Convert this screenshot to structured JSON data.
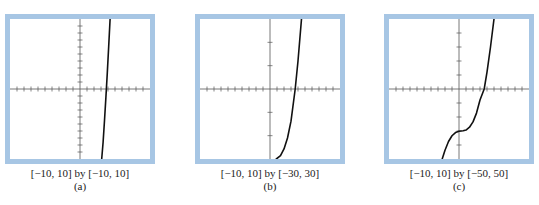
{
  "figure": {
    "panels": [
      {
        "id": "a",
        "window_label": "[−10, 10] by [−10, 10]",
        "panel_label": "(a)"
      },
      {
        "id": "b",
        "window_label": "[−10, 10] by [−30, 30]",
        "panel_label": "(b)"
      },
      {
        "id": "c",
        "window_label": "[−10, 10] by [−50, 50]",
        "panel_label": "(c)"
      }
    ],
    "colors": {
      "frame": "#a7c6e4",
      "axes": "#555555",
      "curve": "#111111"
    }
  },
  "chart_data": [
    {
      "type": "line",
      "title": "(a)",
      "window": "[−10, 10] by [−10, 10]",
      "xlim": [
        -10,
        10
      ],
      "ylim": [
        -10,
        10
      ],
      "xtick_step": 1,
      "ytick_step": 1,
      "grid": false,
      "series": [
        {
          "name": "f(x)",
          "x": [
            3.1,
            3.3,
            3.5,
            3.7,
            3.9,
            4.1,
            4.3
          ],
          "y": [
            -10,
            -7.6,
            -4.5,
            -1.2,
            2.3,
            6.1,
            10
          ]
        }
      ]
    },
    {
      "type": "line",
      "title": "(b)",
      "window": "[−10, 10] by [−30, 30]",
      "xlim": [
        -10,
        10
      ],
      "ylim": [
        -30,
        30
      ],
      "xtick_step": 1,
      "ytick_step": 10,
      "grid": false,
      "series": [
        {
          "name": "f(x)",
          "x": [
            0.9,
            1.5,
            2.0,
            2.5,
            3.0,
            3.6,
            4.0,
            4.5
          ],
          "y": [
            -30,
            -28.6,
            -25.7,
            -21,
            -13.8,
            0,
            12,
            30
          ]
        }
      ]
    },
    {
      "type": "line",
      "title": "(c)",
      "window": "[−10, 10] by [−50, 50]",
      "xlim": [
        -10,
        10
      ],
      "ylim": [
        -50,
        50
      ],
      "xtick_step": 1,
      "ytick_step": 10,
      "grid": false,
      "series": [
        {
          "name": "f(x)",
          "x": [
            -2.4,
            -2.0,
            -1.5,
            -1.0,
            -0.5,
            0.0,
            0.3,
            0.6,
            1.0,
            1.5,
            2.0,
            2.5,
            3.0,
            3.6,
            4.0,
            4.5,
            5.0
          ],
          "y": [
            -50,
            -43.7,
            -37.5,
            -33.4,
            -31.1,
            -30.2,
            -30,
            -29.8,
            -29.3,
            -27.3,
            -23.5,
            -17.2,
            -7.9,
            0,
            12,
            30,
            50
          ]
        }
      ]
    }
  ]
}
